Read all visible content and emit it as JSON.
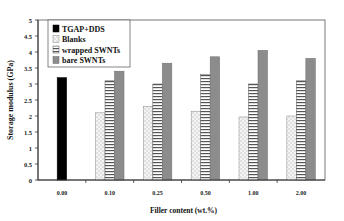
{
  "chart_data": {
    "type": "bar",
    "title": "",
    "xlabel": "Filler content (wt.%)",
    "ylabel": "Storage modulus (GPa)",
    "ylim": [
      0,
      5
    ],
    "yticks": [
      "0",
      "0.5",
      "1",
      "1.5",
      "2",
      "2.5",
      "3",
      "3.5",
      "4",
      "4.5",
      "5"
    ],
    "grid": false,
    "legend_position": "upper left (inside)",
    "categories": [
      "0.00",
      "0.10",
      "0.25",
      "0.50",
      "1.00",
      "2.00"
    ],
    "series": [
      {
        "name": "TGAP+DDS",
        "pattern": "solid-black",
        "values": [
          3.2,
          null,
          null,
          null,
          null,
          null
        ]
      },
      {
        "name": "Blanks",
        "pattern": "dotted-white",
        "values": [
          null,
          2.1,
          2.3,
          2.15,
          1.97,
          2.0
        ]
      },
      {
        "name": "wrapped SWNTs",
        "pattern": "horizontal-stripes",
        "values": [
          null,
          3.1,
          3.0,
          3.3,
          3.0,
          3.1
        ]
      },
      {
        "name": "bare SWNTs",
        "pattern": "solid-gray",
        "values": [
          null,
          3.4,
          3.65,
          3.85,
          4.05,
          3.8
        ]
      }
    ],
    "colors": {
      "tgap": "#000000",
      "blanks_fill": "#f4f4f4",
      "blanks_dot": "#9a9a9a",
      "wrapped_fill": "#ffffff",
      "wrapped_stripe": "#555555",
      "bare": "#8c8c8c",
      "axis": "#333333"
    }
  }
}
